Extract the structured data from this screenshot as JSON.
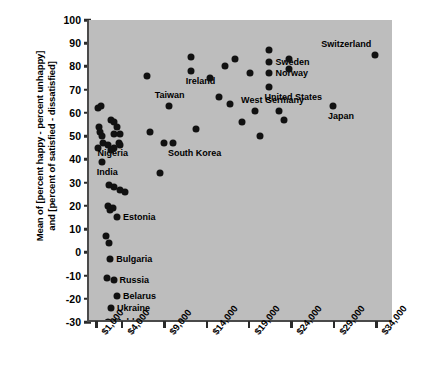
{
  "chart_data": {
    "type": "scatter",
    "title": "",
    "xlabel": "",
    "ylabel_line1": "Mean of [percent happy - percent unhappy]",
    "ylabel_line2": "and [percent of satisfied - dissatisfied]",
    "xlim": [
      0,
      36000
    ],
    "ylim": [
      -30,
      100
    ],
    "grid": false,
    "legend": "none",
    "plot_background": "#bdbdbd",
    "point_color": "#111111",
    "axis_color": "#4a4a4a",
    "xticks": [
      {
        "value": 1000,
        "label": "$1,000"
      },
      {
        "value": 4000,
        "label": "$4,000"
      },
      {
        "value": 9000,
        "label": "$9,000"
      },
      {
        "value": 14000,
        "label": "$14,000"
      },
      {
        "value": 19000,
        "label": "$19,000"
      },
      {
        "value": 24000,
        "label": "$24,000"
      },
      {
        "value": 29000,
        "label": "$29,000"
      },
      {
        "value": 34000,
        "label": "$34,000"
      }
    ],
    "yticks": [
      {
        "value": 100,
        "label": "100"
      },
      {
        "value": 90,
        "label": "90"
      },
      {
        "value": 80,
        "label": "80"
      },
      {
        "value": 70,
        "label": "70"
      },
      {
        "value": 60,
        "label": "60"
      },
      {
        "value": 50,
        "label": "50"
      },
      {
        "value": 40,
        "label": "40"
      },
      {
        "value": 30,
        "label": "30"
      },
      {
        "value": 20,
        "label": "20"
      },
      {
        "value": 10,
        "label": "10"
      },
      {
        "value": 0,
        "label": "0"
      },
      {
        "value": -10,
        "label": "-10"
      },
      {
        "value": -20,
        "label": "-20"
      },
      {
        "value": -30,
        "label": "-30"
      }
    ],
    "points": [
      {
        "x": 1100,
        "y": 62,
        "label": ""
      },
      {
        "x": 1400,
        "y": 63,
        "label": ""
      },
      {
        "x": 1200,
        "y": 54,
        "label": ""
      },
      {
        "x": 1250,
        "y": 52,
        "label": ""
      },
      {
        "x": 1500,
        "y": 50,
        "label": ""
      },
      {
        "x": 1100,
        "y": 45,
        "label": ""
      },
      {
        "x": 1600,
        "y": 47,
        "label": "Nigeria",
        "pos": "below"
      },
      {
        "x": 1500,
        "y": 39,
        "label": "India",
        "pos": "below"
      },
      {
        "x": 2600,
        "y": 57,
        "label": ""
      },
      {
        "x": 3000,
        "y": 56,
        "label": ""
      },
      {
        "x": 2900,
        "y": 51,
        "label": ""
      },
      {
        "x": 3300,
        "y": 54,
        "label": ""
      },
      {
        "x": 3700,
        "y": 51,
        "label": ""
      },
      {
        "x": 3500,
        "y": 47,
        "label": ""
      },
      {
        "x": 3700,
        "y": 46,
        "label": ""
      },
      {
        "x": 3000,
        "y": 45,
        "label": ""
      },
      {
        "x": 2600,
        "y": 44,
        "label": ""
      },
      {
        "x": 2200,
        "y": 46,
        "label": ""
      },
      {
        "x": 2400,
        "y": 29,
        "label": ""
      },
      {
        "x": 3000,
        "y": 28,
        "label": ""
      },
      {
        "x": 3600,
        "y": 27,
        "label": ""
      },
      {
        "x": 4300,
        "y": 26,
        "label": ""
      },
      {
        "x": 2300,
        "y": 20,
        "label": ""
      },
      {
        "x": 2500,
        "y": 18,
        "label": ""
      },
      {
        "x": 2800,
        "y": 19,
        "label": ""
      },
      {
        "x": 3300,
        "y": 15,
        "label": "Estonia",
        "pos": "right"
      },
      {
        "x": 2000,
        "y": 7,
        "label": ""
      },
      {
        "x": 2400,
        "y": 4,
        "label": ""
      },
      {
        "x": 2500,
        "y": -3,
        "label": "Bulgaria",
        "pos": "right"
      },
      {
        "x": 2100,
        "y": -11,
        "label": ""
      },
      {
        "x": 2900,
        "y": -12,
        "label": "Russia",
        "pos": "right"
      },
      {
        "x": 3300,
        "y": -19,
        "label": "Belarus",
        "pos": "right"
      },
      {
        "x": 2600,
        "y": -24,
        "label": "Ukraine",
        "pos": "right"
      },
      {
        "x": 2200,
        "y": -30,
        "label": "Moldova",
        "pos": "right"
      },
      {
        "x": 6900,
        "y": 76,
        "label": ""
      },
      {
        "x": 7200,
        "y": 52,
        "label": ""
      },
      {
        "x": 9400,
        "y": 63,
        "label": "Taiwan",
        "pos": "above"
      },
      {
        "x": 8900,
        "y": 47,
        "label": ""
      },
      {
        "x": 9900,
        "y": 47,
        "label": "South Korea",
        "pos": "below"
      },
      {
        "x": 8400,
        "y": 34,
        "label": ""
      },
      {
        "x": 12000,
        "y": 84,
        "label": ""
      },
      {
        "x": 12000,
        "y": 78,
        "label": "Ireland",
        "pos": "below"
      },
      {
        "x": 12600,
        "y": 53,
        "label": ""
      },
      {
        "x": 14300,
        "y": 75,
        "label": ""
      },
      {
        "x": 16000,
        "y": 80,
        "label": ""
      },
      {
        "x": 15300,
        "y": 67,
        "label": ""
      },
      {
        "x": 16600,
        "y": 64,
        "label": ""
      },
      {
        "x": 17200,
        "y": 83,
        "label": ""
      },
      {
        "x": 18000,
        "y": 56,
        "label": ""
      },
      {
        "x": 19000,
        "y": 77,
        "label": ""
      },
      {
        "x": 19600,
        "y": 61,
        "label": "West Germany",
        "pos": "above"
      },
      {
        "x": 20200,
        "y": 50,
        "label": ""
      },
      {
        "x": 21300,
        "y": 87,
        "label": ""
      },
      {
        "x": 21300,
        "y": 82,
        "label": "Sweden",
        "pos": "right"
      },
      {
        "x": 21300,
        "y": 77,
        "label": "Norway",
        "pos": "right"
      },
      {
        "x": 21300,
        "y": 71,
        "label": "United States",
        "pos": "below"
      },
      {
        "x": 22400,
        "y": 61,
        "label": ""
      },
      {
        "x": 23000,
        "y": 57,
        "label": ""
      },
      {
        "x": 23600,
        "y": 83,
        "label": ""
      },
      {
        "x": 23600,
        "y": 79,
        "label": ""
      },
      {
        "x": 28800,
        "y": 63,
        "label": "Japan",
        "pos": "below"
      },
      {
        "x": 33800,
        "y": 85,
        "label": "Switzerland",
        "pos": "aboveleft"
      }
    ]
  }
}
